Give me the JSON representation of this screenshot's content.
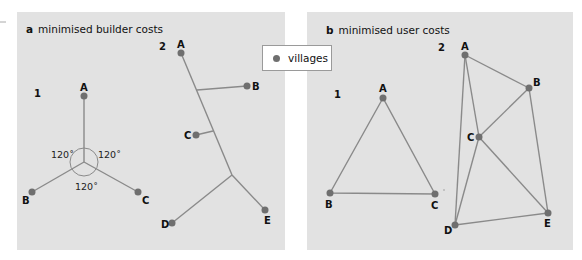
{
  "panels": [
    {
      "letter": "a",
      "title": "minimised builder costs",
      "sub1": {
        "number": "1",
        "labels": {
          "A": "A",
          "B": "B",
          "C": "C"
        },
        "angles": [
          "120˚",
          "120˚",
          "120˚"
        ]
      },
      "sub2": {
        "number": "2",
        "labels": {
          "A": "A",
          "B": "B",
          "C": "C",
          "D": "D",
          "E": "E"
        }
      }
    },
    {
      "letter": "b",
      "title": "minimised user costs",
      "sub1": {
        "number": "1",
        "labels": {
          "A": "A",
          "B": "B",
          "C": "C"
        }
      },
      "sub2": {
        "number": "2",
        "labels": {
          "A": "A",
          "B": "B",
          "C": "C",
          "D": "D",
          "E": "E"
        }
      }
    }
  ],
  "legend": {
    "label": "villages",
    "marker_color": "#6f6f6f"
  },
  "colors": {
    "panel_bg": "#e2e2e2",
    "edge": "#8a8a8a",
    "node": "#6f6f6f"
  }
}
